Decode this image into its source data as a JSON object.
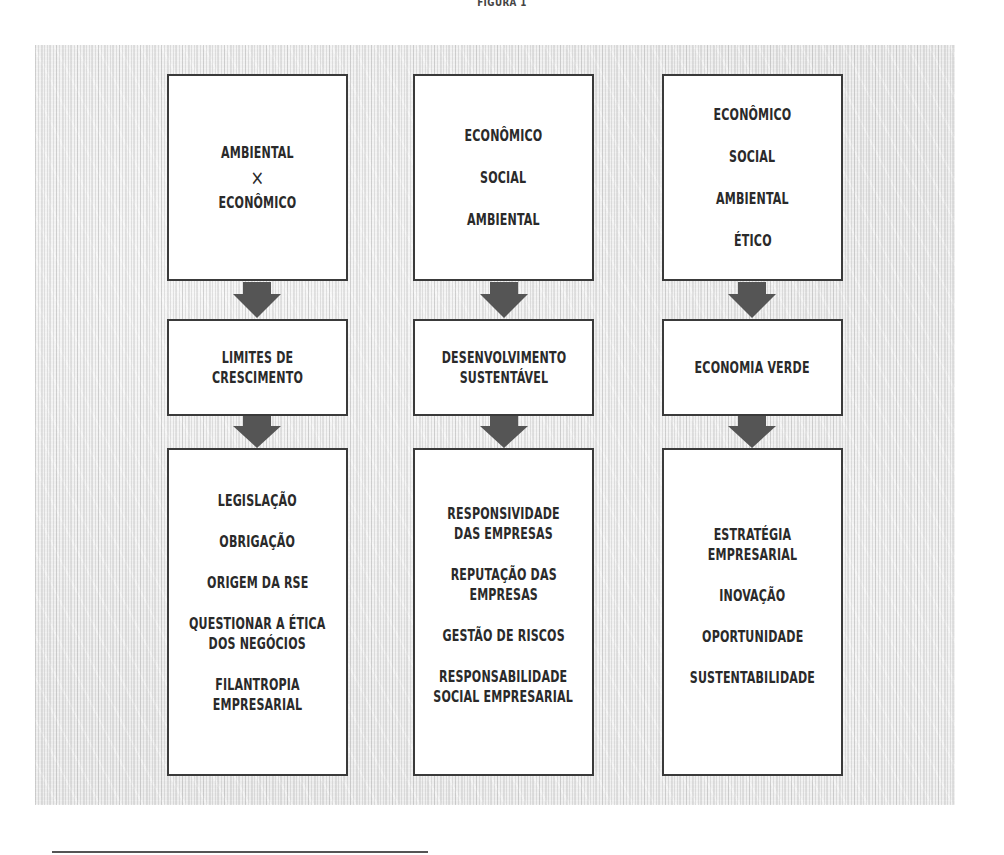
{
  "figure": {
    "title": "FIGURA 1"
  },
  "columns": [
    {
      "top": {
        "items": [
          "AMBIENTAL",
          "×",
          "ECONÔMICO"
        ]
      },
      "middle": {
        "label": "LIMITES DE\nCRESCIMENTO"
      },
      "bottom": {
        "items": [
          "LEGISLAÇÃO",
          "OBRIGAÇÃO",
          "ORIGEM DA RSE",
          "QUESTIONAR A ÉTICA\nDOS NEGÓCIOS",
          "FILANTROPIA\nEMPRESARIAL"
        ]
      }
    },
    {
      "top": {
        "items": [
          "ECONÔMICO",
          "SOCIAL",
          "AMBIENTAL"
        ]
      },
      "middle": {
        "label": "DESENVOLVIMENTO\nSUSTENTÁVEL"
      },
      "bottom": {
        "items": [
          "RESPONSIVIDADE\nDAS EMPRESAS",
          "REPUTAÇÃO DAS\nEMPRESAS",
          "GESTÃO DE RISCOS",
          "RESPONSABILIDADE\nSOCIAL EMPRESARIAL"
        ]
      }
    },
    {
      "top": {
        "items": [
          "ECONÔMICO",
          "SOCIAL",
          "AMBIENTAL",
          "ÉTICO"
        ]
      },
      "middle": {
        "label": "ECONOMIA VERDE"
      },
      "bottom": {
        "items": [
          "ESTRATÉGIA\nEMPRESARIAL",
          "INOVAÇÃO",
          "OPORTUNIDADE",
          "SUSTENTABILIDADE"
        ]
      }
    }
  ],
  "style": {
    "arrow_color": "#555555",
    "box_border_color": "#3a3a3a",
    "text_color": "#2a2a2a"
  }
}
